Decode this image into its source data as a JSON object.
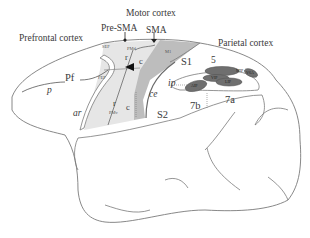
{
  "diagram": {
    "type": "anatomical-brain-lateral-view",
    "region_headers": {
      "prefrontal": "Prefrontal cortex",
      "motor": "Motor cortex",
      "parietal": "Parietal cortex"
    },
    "markers": {
      "pre_sma": "Pre-SMA",
      "sma": "SMA"
    },
    "areas": {
      "sef": "SEF",
      "fef": "FEF",
      "pmd": "PMd",
      "pmv": "PMv",
      "m1": "M1",
      "s1": "S1",
      "s2": "S2",
      "area5": "5",
      "area7a": "7a",
      "area7b": "7b",
      "pf": "Pf",
      "mip": "MIP",
      "vip": "VIP",
      "lip": "LIP",
      "aip": "AIP",
      "v6a": "V6A"
    },
    "subdivisions": {
      "pmd_rostral": "r",
      "pmd_caudal": "c",
      "pmv_rostral": "r",
      "pmv_caudal": "c"
    },
    "sulci": {
      "principal": "p",
      "arcuate": "ar",
      "central": "ce",
      "intraparietal": "ip"
    },
    "colors": {
      "outline": "#7a7a7a",
      "premotor_fill": "#e4e4e4",
      "m1_fill": "#b9b9b9",
      "parietal_dark_fill": "#6f6f6f",
      "background": "#ffffff"
    }
  }
}
